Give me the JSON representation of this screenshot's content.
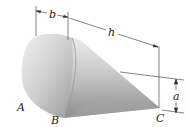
{
  "figure": {
    "labels": {
      "point_A": "A",
      "point_B": "B",
      "point_C": "C"
    },
    "dimensions": {
      "b": "b",
      "h": "h",
      "a": "a"
    },
    "colors": {
      "solid_light": "#e6e6e6",
      "solid_dark": "#8a8a8a",
      "lines": "#222222",
      "background": "#ffffff"
    }
  }
}
